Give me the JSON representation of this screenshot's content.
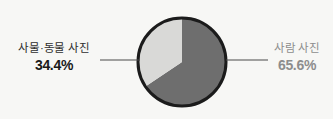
{
  "chart_data": {
    "type": "pie",
    "title": "",
    "categories": [
      "사물·동물 사진",
      "사람 사진"
    ],
    "values": [
      34.4,
      65.6
    ],
    "value_labels": [
      "34.4%",
      "65.6%"
    ],
    "unit": "%",
    "total": 100.0,
    "legend": "none",
    "grid": false,
    "start_angle_deg": 0,
    "direction": "counterclockwise-for-first-slice",
    "slices": [
      {
        "name": "사물·동물 사진",
        "value": 34.4,
        "value_label": "34.4%",
        "color": "#d9d9d7",
        "label_side": "left",
        "label_color": "#2e2e2e",
        "value_color": "#1a1a1a"
      },
      {
        "name": "사람 사진",
        "value": 65.6,
        "value_label": "65.6%",
        "color": "#6e6e6e",
        "label_side": "right",
        "label_color": "#8d8d8d",
        "value_color": "#8d8d8d"
      }
    ]
  },
  "colors": {
    "background": "#f7f7f5",
    "pie_outline": "#1b1b1b",
    "slice_light": "#d9d9d7",
    "slice_dark": "#6e6e6e",
    "leader_line": "#4a4a4a"
  },
  "geometry": {
    "center_x": 182,
    "center_y": 62,
    "radius": 44,
    "outline_width": 3
  },
  "leaders": {
    "left": {
      "x1": 100,
      "x2": 140,
      "y": 60
    },
    "right": {
      "x1": 226,
      "x2": 268,
      "y": 60
    }
  }
}
